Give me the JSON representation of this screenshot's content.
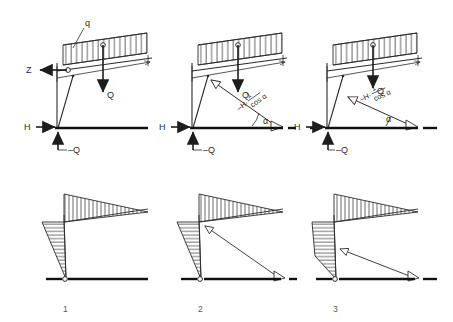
{
  "figure": {
    "panel_numbers": [
      "1",
      "2",
      "3"
    ],
    "colors": {
      "line": "#2b2b2b",
      "ground": "#111111",
      "hatch": "#3a3a3a",
      "label": "#2b2b2b",
      "number": "#55565a",
      "background": "#ffffff"
    }
  },
  "panels": [
    {
      "id": "panel-1",
      "number": "1",
      "labels": {
        "distributed_load": "q",
        "horizontal_reaction": "H",
        "vertical_reaction": "–Q",
        "resultant_load": "Q",
        "thrust": "Z"
      },
      "top_diagram": {
        "name": "free-body-diagram-1",
        "has_hinge_circle": true,
        "has_load_band": true,
        "arrows": [
          "Z-left-arrow",
          "Q-down-arrow",
          "H-right-arrow",
          "minus-Q-up-arrow"
        ]
      },
      "bottom_diagram": {
        "name": "moment-diagram-1",
        "beam_shape": "triangular-tapering-right",
        "column_shape": "triangular-tapering-down",
        "beam_hatch": "vertical",
        "column_hatch": "horizontal",
        "has_force_arrow": false
      }
    },
    {
      "id": "panel-2",
      "number": "2",
      "labels": {
        "horizontal_reaction": "H",
        "vertical_reaction": "–Q",
        "resultant_load": "Q",
        "angle": "α",
        "inclined_force_prefix": "–H·",
        "inclined_force_numerator": "1",
        "inclined_force_denominator": "cos α"
      },
      "top_diagram": {
        "name": "free-body-diagram-2",
        "has_hinge_circle": true,
        "has_load_band": true,
        "arrows": [
          "Q-down-arrow",
          "H-right-arrow",
          "minus-Q-up-arrow",
          "inclined-thrust-arrow",
          "angle-arc"
        ]
      },
      "bottom_diagram": {
        "name": "moment-diagram-2",
        "beam_shape": "triangular-tapering-right",
        "column_shape": "triangular-tapering-down",
        "beam_hatch": "vertical",
        "column_hatch": "horizontal",
        "has_force_arrow": true,
        "force_arrow": "inclined-thrust-arrow-to-knee"
      }
    },
    {
      "id": "panel-3",
      "number": "3",
      "labels": {
        "horizontal_reaction": "H",
        "vertical_reaction": "–Q",
        "resultant_load": "Q",
        "angle": "α",
        "inclined_force_prefix": "–H·",
        "inclined_force_numerator": "1",
        "inclined_force_denominator": "cos α"
      },
      "top_diagram": {
        "name": "free-body-diagram-3",
        "has_hinge_circle": true,
        "has_load_band": true,
        "arrows": [
          "Q-down-arrow",
          "H-right-arrow",
          "minus-Q-up-arrow",
          "inclined-thrust-arrow-low",
          "angle-arc"
        ]
      },
      "bottom_diagram": {
        "name": "moment-diagram-3",
        "beam_shape": "triangular-tapering-right",
        "column_shape": "rectangular-then-tapering-down",
        "beam_hatch": "vertical",
        "column_hatch": "horizontal",
        "has_force_arrow": true,
        "force_arrow": "inclined-thrust-arrow-to-midcolumn"
      }
    }
  ]
}
